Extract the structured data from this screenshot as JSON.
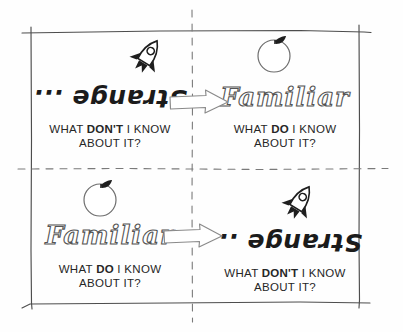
{
  "diagram": {
    "paper_color": "#fefefe",
    "ink_color": "#2b2b2b",
    "layout": "2x2 quadrant matrix with dashed dividers and hand-drawn border"
  },
  "quadrants": {
    "top_left": {
      "icon": "rocket-icon",
      "headword": "Strange ...",
      "headword_style": "upside-down",
      "caption_before": "WHAT ",
      "caption_emphasis": "DON'T",
      "caption_after": " I KNOW",
      "caption_line2": "ABOUT IT?"
    },
    "top_right": {
      "icon": "apple-icon",
      "headword": "Familiar",
      "headword_style": "bubble-outline",
      "caption_before": "WHAT ",
      "caption_emphasis": "DO",
      "caption_after": " I KNOW",
      "caption_line2": "ABOUT IT?"
    },
    "bottom_left": {
      "icon": "apple-icon",
      "headword": "Familiar",
      "headword_style": "bubble-outline",
      "caption_before": "WHAT ",
      "caption_emphasis": "DO",
      "caption_after": " I KNOW",
      "caption_line2": "ABOUT IT?"
    },
    "bottom_right": {
      "icon": "rocket-icon",
      "headword": "Strange ...",
      "headword_style": "upside-down",
      "caption_before": "WHAT ",
      "caption_emphasis": "DON'T",
      "caption_after": " I KNOW",
      "caption_line2": "ABOUT IT?"
    }
  },
  "arrows": {
    "top": {
      "name": "arrow-strange-to-familiar",
      "direction": "right"
    },
    "bottom": {
      "name": "arrow-familiar-to-strange",
      "direction": "right"
    }
  }
}
